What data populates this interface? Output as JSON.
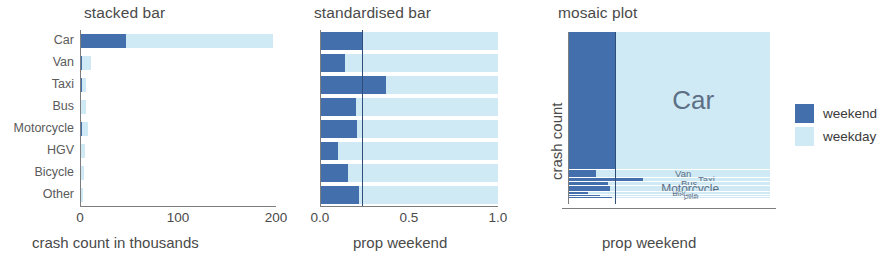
{
  "figure": {
    "categories": [
      "Car",
      "Van",
      "Taxi",
      "Bus",
      "Motorcycle",
      "HGV",
      "Bicycle",
      "Other"
    ],
    "colors": {
      "weekend": "#4370ac",
      "weekday": "#cfe9f5",
      "axis": "#7d7d7d",
      "reference_line": "#2f4f7a",
      "text": "#4a4a4a",
      "mosaic_label": "#5d6f85"
    }
  },
  "legend": {
    "position": "right",
    "items": [
      {
        "label": "weekend",
        "color": "#4370ac"
      },
      {
        "label": "weekday",
        "color": "#cfe9f5"
      }
    ]
  },
  "chart_data": [
    {
      "type": "bar",
      "id": "stacked-bar",
      "title": "stacked bar",
      "orientation": "horizontal",
      "stacked": true,
      "xlabel": "crash count in thousands",
      "ylabel": "",
      "xlim": [
        0,
        200
      ],
      "xticks": [
        0,
        100,
        200
      ],
      "xticklabels": [
        "0",
        "100",
        "200"
      ],
      "grid": false,
      "categories": [
        "Car",
        "Van",
        "Taxi",
        "Bus",
        "Motorcycle",
        "HGV",
        "Bicycle",
        "Other"
      ],
      "series": [
        {
          "name": "weekend",
          "color": "#4370ac",
          "values": [
            47.0,
            1.6,
            2.3,
            1.2,
            1.7,
            0.4,
            0.5,
            0.4
          ]
        },
        {
          "name": "weekday",
          "color": "#cfe9f5",
          "values": [
            150.0,
            9.6,
            3.9,
            4.8,
            6.4,
            3.6,
            2.6,
            1.4
          ]
        }
      ],
      "totals": [
        197.0,
        11.2,
        6.2,
        6.0,
        8.1,
        4.0,
        3.1,
        1.8
      ],
      "units": "thousands"
    },
    {
      "type": "bar",
      "id": "standardised-bar",
      "title": "standardised bar",
      "orientation": "horizontal",
      "stacked": true,
      "normalised": true,
      "xlabel": "prop weekend",
      "ylabel": "",
      "xlim": [
        0,
        1
      ],
      "xticks": [
        0.0,
        0.5,
        1.0
      ],
      "xticklabels": [
        "0.0",
        "0.5",
        "1.0"
      ],
      "grid": false,
      "categories": [
        "Car",
        "Van",
        "Taxi",
        "Bus",
        "Motorcycle",
        "HGV",
        "Bicycle",
        "Other"
      ],
      "series": [
        {
          "name": "weekend",
          "color": "#4370ac",
          "values": [
            0.24,
            0.14,
            0.37,
            0.2,
            0.21,
            0.1,
            0.16,
            0.22
          ]
        },
        {
          "name": "weekday",
          "color": "#cfe9f5",
          "values": [
            0.76,
            0.86,
            0.63,
            0.8,
            0.79,
            0.9,
            0.84,
            0.78
          ]
        }
      ],
      "reference_line": {
        "value": 0.235,
        "color": "#2f4f7a"
      }
    },
    {
      "type": "bar",
      "id": "mosaic-plot",
      "subtype": "mosaic",
      "title": "mosaic plot",
      "xlabel": "prop weekend",
      "ylabel": "crash count",
      "xlim": [
        0,
        1
      ],
      "grid": false,
      "categories": [
        "Car",
        "Van",
        "Taxi",
        "Bus",
        "Motorcycle",
        "HGV",
        "Bicycle",
        "Other"
      ],
      "row_heights": [
        0.8015,
        0.0455,
        0.0252,
        0.0244,
        0.0329,
        0.0163,
        0.0126,
        0.0073
      ],
      "row_height_units": "proportion of total crash count",
      "widths": [
        0.24,
        0.14,
        0.37,
        0.2,
        0.21,
        0.1,
        0.16,
        0.22
      ],
      "width_units": "prop weekend",
      "series": [
        {
          "name": "weekend",
          "color": "#4370ac"
        },
        {
          "name": "weekday",
          "color": "#cfe9f5"
        }
      ],
      "reference_line": {
        "value": 0.235,
        "color": "#2f4f7a"
      },
      "label_sizes": [
        26,
        9.5,
        9.5,
        9.5,
        12,
        6,
        8,
        6
      ]
    }
  ]
}
